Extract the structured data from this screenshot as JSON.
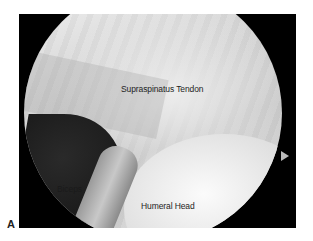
{
  "figure": {
    "panel_label": "A",
    "labels": {
      "supraspinatus": "Supraspinatus Tendon",
      "humeral_head": "Humeral Head",
      "biceps": "Biceps"
    },
    "colors": {
      "frame_background": "#000000",
      "page_background": "#ffffff",
      "label_text": "#1e1e1e"
    }
  }
}
